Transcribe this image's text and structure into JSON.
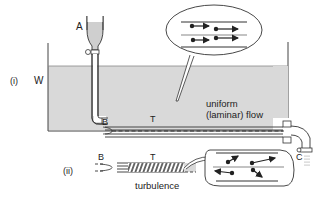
{
  "diagram": {
    "labels": {
      "part_i": "(i)",
      "part_ii": "(ii)",
      "tank": "W",
      "reservoir": "A",
      "inlet_i": "B",
      "tube_i": "T",
      "outlet": "C",
      "inlet_ii": "B",
      "tube_ii": "T",
      "laminar_line1": "uniform",
      "laminar_line2": "(laminar) flow",
      "turbulence": "turbulence"
    },
    "callouts": {
      "laminar": {
        "description": "parallel particle paths",
        "arrows": 4
      },
      "turbulent": {
        "description": "random particle paths",
        "arrows": 4
      }
    },
    "colors": {
      "water": "#d9d9d9",
      "line": "#333333",
      "background": "#ffffff"
    }
  }
}
